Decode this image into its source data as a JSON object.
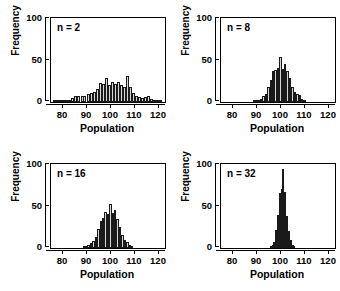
{
  "figure": {
    "layout": "2x2 grid of histograms",
    "panels_order": [
      "n2",
      "n8",
      "n16",
      "n32"
    ]
  },
  "chart_data": [
    {
      "type": "bar",
      "title": "n = 2",
      "xlabel": "Population",
      "ylabel": "Frequency",
      "xlim": [
        75,
        122
      ],
      "ylim": [
        0,
        120
      ],
      "xticks": [
        80,
        90,
        100,
        110,
        120
      ],
      "yticks": [
        0,
        50,
        100
      ],
      "grid": false,
      "legend": "none",
      "bin_width": 1.25,
      "bin_centers": [
        76.5,
        77.8,
        79.0,
        80.3,
        81.5,
        82.8,
        84.0,
        85.3,
        86.5,
        87.8,
        89.0,
        90.3,
        91.5,
        92.8,
        94.0,
        95.3,
        96.5,
        97.8,
        99.0,
        100.3,
        101.5,
        102.8,
        104.0,
        105.3,
        106.5,
        107.8,
        109.0,
        110.3,
        111.5,
        112.8,
        114.0,
        115.3,
        116.5,
        117.8,
        119.0,
        120.3
      ],
      "values": [
        1,
        1,
        2,
        1,
        2,
        3,
        6,
        8,
        8,
        9,
        9,
        11,
        13,
        15,
        18,
        27,
        26,
        34,
        25,
        29,
        26,
        28,
        24,
        22,
        37,
        22,
        13,
        8,
        7,
        6,
        7,
        8,
        5,
        3,
        2,
        1
      ]
    },
    {
      "type": "bar",
      "title": "n = 8",
      "xlabel": "Population",
      "ylabel": "Frequency",
      "xlim": [
        75,
        122
      ],
      "ylim": [
        0,
        120
      ],
      "xticks": [
        80,
        90,
        100,
        110,
        120
      ],
      "yticks": [
        0,
        50,
        100
      ],
      "grid": false,
      "legend": "none",
      "bin_width": 1.0,
      "bin_centers": [
        88.5,
        89.5,
        90.5,
        91.5,
        92.5,
        93.5,
        94.5,
        95.5,
        96.5,
        97.5,
        98.5,
        99.5,
        100.5,
        101.5,
        102.5,
        103.5,
        104.5,
        105.5,
        106.5,
        107.5,
        108.5,
        109.5
      ],
      "values": [
        1,
        2,
        3,
        5,
        8,
        12,
        22,
        31,
        44,
        46,
        48,
        64,
        47,
        55,
        45,
        34,
        22,
        15,
        12,
        10,
        4,
        2
      ]
    },
    {
      "type": "bar",
      "title": "n = 16",
      "xlabel": "Population",
      "ylabel": "Frequency",
      "xlim": [
        75,
        122
      ],
      "ylim": [
        0,
        120
      ],
      "xticks": [
        80,
        90,
        100,
        110,
        120
      ],
      "yticks": [
        0,
        50,
        100
      ],
      "grid": false,
      "legend": "none",
      "bin_width": 1.0,
      "bin_centers": [
        88.5,
        89.5,
        90.5,
        91.5,
        92.5,
        93.5,
        94.5,
        95.5,
        96.5,
        97.5,
        98.5,
        99.5,
        100.5,
        101.5,
        102.5,
        103.5,
        104.5,
        105.5,
        106.5,
        107.5,
        108.5
      ],
      "values": [
        1,
        2,
        4,
        7,
        10,
        16,
        27,
        38,
        43,
        52,
        48,
        63,
        50,
        55,
        41,
        30,
        19,
        12,
        9,
        4,
        2
      ]
    },
    {
      "type": "bar",
      "title": "n = 32",
      "xlabel": "Population",
      "ylabel": "Frequency",
      "xlim": [
        75,
        122
      ],
      "ylim": [
        0,
        120
      ],
      "xticks": [
        80,
        90,
        100,
        110,
        120
      ],
      "yticks": [
        0,
        50,
        100
      ],
      "grid": false,
      "legend": "none",
      "bin_width": 0.75,
      "bin_centers": [
        95.5,
        96.2,
        97.0,
        97.7,
        98.5,
        99.2,
        100.0,
        100.7,
        101.5,
        102.2,
        103.0,
        103.7,
        104.5,
        105.2
      ],
      "values": [
        2,
        4,
        9,
        26,
        47,
        79,
        84,
        113,
        80,
        46,
        24,
        12,
        5,
        2
      ]
    }
  ],
  "axes": {
    "ylabel": "Frequency",
    "xlabel": "Population",
    "yticks": [
      "0",
      "50",
      "100"
    ],
    "xticks": [
      "80",
      "90",
      "100",
      "110",
      "120"
    ]
  }
}
